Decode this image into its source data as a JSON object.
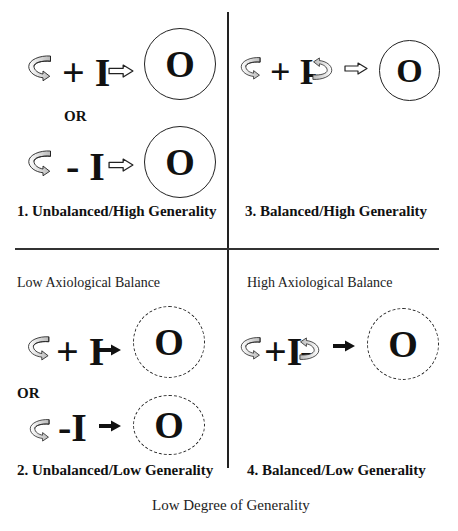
{
  "diagram": {
    "quadrants": [
      {
        "id": 1,
        "label": "1. Unbalanced/High Generality",
        "rows": [
          {
            "input": "+ I",
            "arrow": "hollow-arrow",
            "output": "O",
            "circle": "solid"
          },
          {
            "input": "- I",
            "arrow": "hollow-arrow",
            "output": "O",
            "circle": "solid"
          }
        ],
        "separator": "OR"
      },
      {
        "id": 3,
        "label": "3. Balanced/High Generality",
        "rows": [
          {
            "input": "+ I",
            "suffix": "-",
            "arrow": "hollow-arrow",
            "output": "O",
            "circle": "solid"
          }
        ]
      },
      {
        "id": 2,
        "heading": "Low Axiological Balance",
        "label": "2. Unbalanced/Low Generality",
        "rows": [
          {
            "input": "+ I",
            "arrow": "solid-arrow",
            "output": "O",
            "circle": "dashed"
          },
          {
            "input": "-I",
            "arrow": "solid-arrow",
            "output": "O",
            "circle": "dashed"
          }
        ],
        "separator": "OR"
      },
      {
        "id": 4,
        "heading": "High Axiological Balance",
        "label": "4. Balanced/Low Generality",
        "rows": [
          {
            "input": "+I",
            "suffix": "-",
            "arrow": "solid-arrow",
            "output": "O",
            "circle": "dashed"
          }
        ]
      }
    ],
    "bottom_axis_label": "Low Degree of Generality",
    "icons": {
      "curved_arrow": "curved-arrow-icon",
      "hollow_arrow": "hollow-right-arrow-icon",
      "solid_arrow": "solid-right-arrow-icon"
    }
  }
}
